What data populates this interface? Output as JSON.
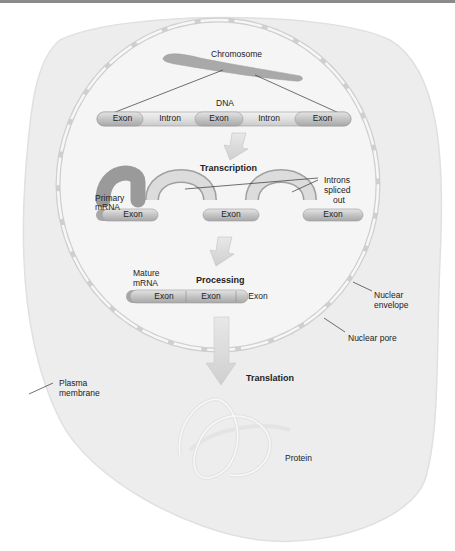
{
  "colors": {
    "cell_fill": "#ececec",
    "nucleus_fill": "#f4f4f4",
    "envelope": "#d4d4d4",
    "exon": "#c6c6c6",
    "intron": "#e2e2e2",
    "arrow": "#d8d8d8",
    "chromosome": "#a8a8a8"
  },
  "labels": {
    "chromosome": "Chromosome",
    "dna": "DNA",
    "transcription": "Transcription",
    "primary_mrna_1": "Primary",
    "primary_mrna_2": "mRNA",
    "introns_1": "Introns",
    "introns_2": "spliced",
    "introns_3": "out",
    "mature_mrna_1": "Mature",
    "mature_mrna_2": "mRNA",
    "processing": "Processing",
    "nuclear_envelope_1": "Nuclear",
    "nuclear_envelope_2": "envelope",
    "nuclear_pore": "Nuclear pore",
    "translation": "Translation",
    "plasma_membrane_1": "Plasma",
    "plasma_membrane_2": "membrane",
    "protein": "Protein"
  },
  "dna_segments": [
    "Exon",
    "Intron",
    "Exon",
    "Intron",
    "Exon"
  ],
  "primary_mrna_segments": [
    "Exon",
    "Exon",
    "Exon"
  ],
  "mature_mrna_segments": [
    "Exon",
    "Exon",
    "Exon"
  ]
}
